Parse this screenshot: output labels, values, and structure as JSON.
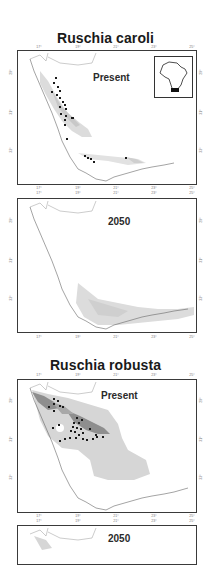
{
  "figure": {
    "species": [
      {
        "name": "Ruschia caroli",
        "panels": [
          {
            "period": "Present",
            "has_inset": true
          },
          {
            "period": "2050",
            "has_inset": false
          }
        ]
      },
      {
        "name": "Ruschia robusta",
        "panels": [
          {
            "period": "Present",
            "has_inset": false
          },
          {
            "period": "2050",
            "has_inset": false
          }
        ]
      }
    ],
    "longitude_ticks": [
      "17°",
      "19°",
      "21°",
      "23°",
      "25°"
    ],
    "latitude_ticks": [
      "29°",
      "31°",
      "33°"
    ],
    "inset": {
      "label": "Africa locator",
      "highlight": "South-western South Africa"
    },
    "colors": {
      "frame": "#3a3a3a",
      "coastline": "#555555",
      "suitability_low": "#d9d9d9",
      "suitability_high": "#8c8c8c",
      "occurrence_point": "#1a1a1a"
    }
  }
}
